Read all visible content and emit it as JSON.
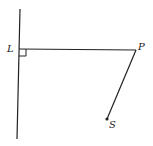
{
  "diagram": {
    "points": {
      "L": {
        "label": "L"
      },
      "P": {
        "label": "P"
      },
      "S": {
        "label": "S"
      }
    },
    "elements": {
      "line": "vertical line through L",
      "segment_LP": "perpendicular segment from L to P",
      "segment_PS": "segment from P to S",
      "right_angle_marker": "right angle at L"
    },
    "colors": {
      "stroke": "#222222",
      "background": "#ffffff"
    }
  }
}
